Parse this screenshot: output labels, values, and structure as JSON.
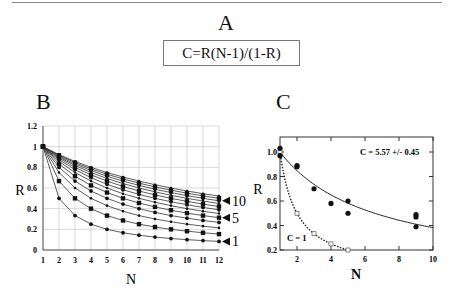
{
  "panel_a": {
    "label": "A",
    "formula": "C=R(N-1)/(1-R)"
  },
  "panel_b": {
    "label": "B"
  },
  "panel_c": {
    "label": "C"
  },
  "chart_data": [
    {
      "type": "line",
      "panel": "B",
      "title": "",
      "xlabel": "N",
      "ylabel": "R",
      "x": [
        1,
        2,
        3,
        4,
        5,
        6,
        7,
        8,
        9,
        10,
        11,
        12
      ],
      "xlim": [
        1,
        12
      ],
      "ylim": [
        0,
        1.2
      ],
      "yticks": [
        "0",
        "0.2",
        "0.4",
        "0.6",
        "0.8",
        "1",
        "1.2"
      ],
      "xticks": [
        "1",
        "2",
        "3",
        "4",
        "5",
        "6",
        "7",
        "8",
        "9",
        "10",
        "11",
        "12"
      ],
      "grid": true,
      "formula": "R = C/(C+N-1)",
      "series": [
        {
          "name": "C=1",
          "values": [
            1.0,
            0.5,
            0.333,
            0.25,
            0.2,
            0.167,
            0.143,
            0.125,
            0.111,
            0.1,
            0.091,
            0.083
          ]
        },
        {
          "name": "C=2",
          "values": [
            1.0,
            0.667,
            0.5,
            0.4,
            0.333,
            0.286,
            0.25,
            0.222,
            0.2,
            0.182,
            0.167,
            0.154
          ]
        },
        {
          "name": "C=3",
          "values": [
            1.0,
            0.75,
            0.6,
            0.5,
            0.429,
            0.375,
            0.333,
            0.3,
            0.273,
            0.25,
            0.231,
            0.214
          ]
        },
        {
          "name": "C=4",
          "values": [
            1.0,
            0.8,
            0.667,
            0.571,
            0.5,
            0.444,
            0.4,
            0.364,
            0.333,
            0.308,
            0.286,
            0.267
          ]
        },
        {
          "name": "C=5",
          "values": [
            1.0,
            0.833,
            0.714,
            0.625,
            0.556,
            0.5,
            0.455,
            0.417,
            0.385,
            0.357,
            0.333,
            0.313
          ]
        },
        {
          "name": "C=6",
          "values": [
            1.0,
            0.857,
            0.75,
            0.667,
            0.6,
            0.545,
            0.5,
            0.462,
            0.429,
            0.4,
            0.375,
            0.353
          ]
        },
        {
          "name": "C=7",
          "values": [
            1.0,
            0.875,
            0.778,
            0.7,
            0.636,
            0.583,
            0.538,
            0.5,
            0.467,
            0.438,
            0.412,
            0.389
          ]
        },
        {
          "name": "C=8",
          "values": [
            1.0,
            0.889,
            0.8,
            0.727,
            0.667,
            0.615,
            0.571,
            0.533,
            0.5,
            0.471,
            0.444,
            0.421
          ]
        },
        {
          "name": "C=9",
          "values": [
            1.0,
            0.9,
            0.818,
            0.75,
            0.692,
            0.643,
            0.6,
            0.563,
            0.529,
            0.5,
            0.474,
            0.45
          ]
        },
        {
          "name": "C=10",
          "values": [
            1.0,
            0.909,
            0.833,
            0.769,
            0.714,
            0.667,
            0.625,
            0.588,
            0.556,
            0.526,
            0.5,
            0.476
          ]
        },
        {
          "name": "C=11",
          "values": [
            1.0,
            0.917,
            0.846,
            0.786,
            0.733,
            0.688,
            0.647,
            0.611,
            0.579,
            0.55,
            0.524,
            0.5
          ]
        },
        {
          "name": "C=12",
          "values": [
            1.0,
            0.923,
            0.857,
            0.8,
            0.75,
            0.706,
            0.667,
            0.632,
            0.6,
            0.571,
            0.545,
            0.522
          ]
        }
      ],
      "annotations": [
        {
          "text": "10",
          "y": 0.476
        },
        {
          "text": "5",
          "y": 0.313
        },
        {
          "text": "1",
          "y": 0.083
        }
      ]
    },
    {
      "type": "scatter",
      "panel": "C",
      "title": "",
      "xlabel": "N",
      "ylabel": "R",
      "xlim": [
        1,
        10
      ],
      "ylim": [
        0.2,
        1.06
      ],
      "xticks": [
        "2",
        "4",
        "6",
        "8",
        "10"
      ],
      "yticks": [
        "0.2",
        "0.4",
        "0.6",
        "0.8",
        "1.0"
      ],
      "grid": false,
      "series": [
        {
          "name": "data",
          "marker": "filled-circle",
          "points": [
            [
              1,
              1.03
            ],
            [
              1,
              0.97
            ],
            [
              2,
              0.89
            ],
            [
              2,
              0.88
            ],
            [
              3,
              0.7
            ],
            [
              4,
              0.58
            ],
            [
              5,
              0.6
            ],
            [
              5,
              0.5
            ],
            [
              9,
              0.49
            ],
            [
              9,
              0.47
            ],
            [
              9,
              0.39
            ]
          ]
        },
        {
          "name": "fit C=5.57",
          "style": "solid-line",
          "formula": "R = 5.57/(5.57+N-1)"
        },
        {
          "name": "C = 1",
          "style": "dotted-line",
          "marker": "open-square",
          "points": [
            [
              1,
              1.0
            ],
            [
              2,
              0.5
            ],
            [
              3,
              0.333
            ],
            [
              4,
              0.25
            ],
            [
              5,
              0.2
            ]
          ]
        }
      ],
      "annotations": [
        {
          "text": "C = 5.57 +/- 0.45"
        },
        {
          "text": "C = 1"
        }
      ]
    }
  ]
}
